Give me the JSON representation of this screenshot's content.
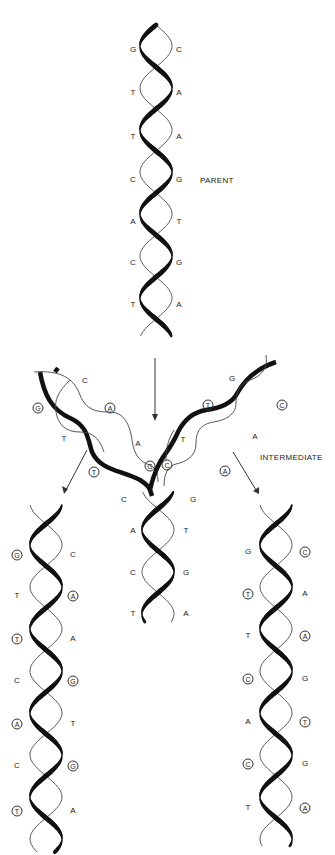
{
  "labels": {
    "parent": "PARENT",
    "intermediate": "INTERMEDIATE"
  },
  "parent": {
    "left": [
      "G",
      "T",
      "T",
      "C",
      "A",
      "C",
      "T"
    ],
    "right": [
      "C",
      "A",
      "A",
      "G",
      "T",
      "G",
      "A"
    ]
  },
  "intermediate": {
    "left_arm": {
      "top": "C",
      "pairs": [
        {
          "left": "G",
          "left_new": true,
          "right": "A",
          "right_new": true
        },
        {
          "left": "T",
          "left_new": false,
          "right": "A",
          "right_new": false
        },
        {
          "left": "T",
          "left_new": true,
          "right": "G",
          "right_new": true
        }
      ]
    },
    "right_arm": {
      "top": "G",
      "pairs": [
        {
          "left": "T",
          "left_new": true,
          "right": "C",
          "right_new": true
        },
        {
          "left": "T",
          "left_new": false,
          "right": "A",
          "right_new": false
        },
        {
          "left": "C",
          "left_new": true,
          "right": "A",
          "right_new": true
        }
      ]
    },
    "stem": {
      "left": [
        "C",
        "A",
        "C",
        "T"
      ],
      "right": [
        "G",
        "T",
        "G",
        "A"
      ]
    }
  },
  "daughter_left": {
    "left": [
      {
        "base": "G",
        "new": true
      },
      {
        "base": "T",
        "new": false
      },
      {
        "base": "T",
        "new": true
      },
      {
        "base": "C",
        "new": false
      },
      {
        "base": "A",
        "new": true
      },
      {
        "base": "C",
        "new": false
      },
      {
        "base": "T",
        "new": true
      }
    ],
    "right": [
      {
        "base": "C",
        "new": false
      },
      {
        "base": "A",
        "new": true
      },
      {
        "base": "A",
        "new": false
      },
      {
        "base": "G",
        "new": true
      },
      {
        "base": "T",
        "new": false
      },
      {
        "base": "G",
        "new": true
      },
      {
        "base": "A",
        "new": false
      }
    ]
  },
  "daughter_right": {
    "left": [
      {
        "base": "G",
        "new": false
      },
      {
        "base": "T",
        "new": true
      },
      {
        "base": "T",
        "new": false
      },
      {
        "base": "C",
        "new": true
      },
      {
        "base": "A",
        "new": false
      },
      {
        "base": "C",
        "new": true
      },
      {
        "base": "T",
        "new": false
      }
    ],
    "right": [
      {
        "base": "C",
        "new": true
      },
      {
        "base": "A",
        "new": false
      },
      {
        "base": "A",
        "new": true
      },
      {
        "base": "G",
        "new": false
      },
      {
        "base": "T",
        "new": true
      },
      {
        "base": "G",
        "new": false
      },
      {
        "base": "A",
        "new": true
      }
    ]
  },
  "colors": {
    "ink": "#111111",
    "background": "#ffffff"
  }
}
